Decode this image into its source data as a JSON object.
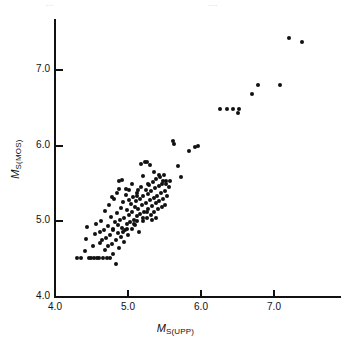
{
  "figure": {
    "page_fragments": {
      "left": "...",
      "right": "...."
    }
  },
  "chart_data": {
    "type": "scatter",
    "title": "",
    "xlabel": "M_S(UPP)",
    "ylabel": "M_S(MOS)",
    "xlabel_main": "M",
    "xlabel_sub": "S(UPP)",
    "ylabel_main": "M",
    "ylabel_sub": "S(MOS)",
    "xlim": [
      4.0,
      7.9
    ],
    "ylim": [
      4.0,
      7.7
    ],
    "xticks": [
      4.0,
      5.0,
      6.0,
      7.0
    ],
    "yticks": [
      4.0,
      5.0,
      6.0,
      7.0
    ],
    "xtick_labels": [
      "4.0",
      "5.0",
      "6.0",
      "7.0"
    ],
    "ytick_labels": [
      "4.0",
      "5.0",
      "6.0",
      "7.0"
    ],
    "grid": false,
    "legend": false,
    "marker": "filled-circle",
    "marker_color": "#111111",
    "n_points": 152,
    "points": [
      [
        4.3,
        4.51
      ],
      [
        4.36,
        4.51
      ],
      [
        4.41,
        4.61
      ],
      [
        4.43,
        4.77
      ],
      [
        4.44,
        4.93
      ],
      [
        4.47,
        4.51
      ],
      [
        4.49,
        4.51
      ],
      [
        4.52,
        4.67
      ],
      [
        4.54,
        4.51
      ],
      [
        4.55,
        4.83
      ],
      [
        4.56,
        4.97
      ],
      [
        4.58,
        4.51
      ],
      [
        4.6,
        4.51
      ],
      [
        4.61,
        4.72
      ],
      [
        4.62,
        4.86
      ],
      [
        4.63,
        5.01
      ],
      [
        4.65,
        4.75
      ],
      [
        4.66,
        4.51
      ],
      [
        4.67,
        4.89
      ],
      [
        4.68,
        4.62
      ],
      [
        4.69,
        5.14
      ],
      [
        4.7,
        4.78
      ],
      [
        4.71,
        4.51
      ],
      [
        4.72,
        4.94
      ],
      [
        4.73,
        4.67
      ],
      [
        4.74,
        5.22
      ],
      [
        4.75,
        4.82
      ],
      [
        4.76,
        4.51
      ],
      [
        4.77,
        5.06
      ],
      [
        4.78,
        4.7
      ],
      [
        4.79,
        4.88
      ],
      [
        4.8,
        4.57
      ],
      [
        4.81,
        5.3
      ],
      [
        4.82,
        4.99
      ],
      [
        4.83,
        4.76
      ],
      [
        4.84,
        4.43
      ],
      [
        4.85,
        5.11
      ],
      [
        4.86,
        4.84
      ],
      [
        4.87,
        5.43
      ],
      [
        4.88,
        4.65
      ],
      [
        4.89,
        5.02
      ],
      [
        4.9,
        4.79
      ],
      [
        4.91,
        5.18
      ],
      [
        4.92,
        4.91
      ],
      [
        4.93,
        5.26
      ],
      [
        4.94,
        4.73
      ],
      [
        4.95,
        5.05
      ],
      [
        4.96,
        4.88
      ],
      [
        4.97,
        5.35
      ],
      [
        4.98,
        4.96
      ],
      [
        4.99,
        5.15
      ],
      [
        5.0,
        4.82
      ],
      [
        5.01,
        5.08
      ],
      [
        5.02,
        5.41
      ],
      [
        5.03,
        4.99
      ],
      [
        5.04,
        5.23
      ],
      [
        5.05,
        4.9
      ],
      [
        5.06,
        5.12
      ],
      [
        5.07,
        5.32
      ],
      [
        5.08,
        5.02
      ],
      [
        5.09,
        5.19
      ],
      [
        5.1,
        4.95
      ],
      [
        5.11,
        5.27
      ],
      [
        5.12,
        5.07
      ],
      [
        5.13,
        5.38
      ],
      [
        5.14,
        5.16
      ],
      [
        5.15,
        4.86
      ],
      [
        5.16,
        5.29
      ],
      [
        5.17,
        5.1
      ],
      [
        5.18,
        5.45
      ],
      [
        5.19,
        5.22
      ],
      [
        5.2,
        5.01
      ],
      [
        5.21,
        5.33
      ],
      [
        5.22,
        5.13
      ],
      [
        5.23,
        5.78
      ],
      [
        5.24,
        5.41
      ],
      [
        5.25,
        5.25
      ],
      [
        5.26,
        5.05
      ],
      [
        5.27,
        5.36
      ],
      [
        5.28,
        5.17
      ],
      [
        5.29,
        5.48
      ],
      [
        5.3,
        5.28
      ],
      [
        5.31,
        5.09
      ],
      [
        5.32,
        5.4
      ],
      [
        5.33,
        5.21
      ],
      [
        5.34,
        5.52
      ],
      [
        5.35,
        5.31
      ],
      [
        5.36,
        5.13
      ],
      [
        5.37,
        5.44
      ],
      [
        5.38,
        5.24
      ],
      [
        5.39,
        5.56
      ],
      [
        5.4,
        5.34
      ],
      [
        5.41,
        5.16
      ],
      [
        5.42,
        5.47
      ],
      [
        5.43,
        5.27
      ],
      [
        5.44,
        5.59
      ],
      [
        5.45,
        5.37
      ],
      [
        5.46,
        5.19
      ],
      [
        5.47,
        5.5
      ],
      [
        5.48,
        5.3
      ],
      [
        5.49,
        5.62
      ],
      [
        5.5,
        5.4
      ],
      [
        5.51,
        5.22
      ],
      [
        5.52,
        5.53
      ],
      [
        5.53,
        5.33
      ],
      [
        4.88,
        5.53
      ],
      [
        4.92,
        5.55
      ],
      [
        5.18,
        5.76
      ],
      [
        5.26,
        5.78
      ],
      [
        5.3,
        5.74
      ],
      [
        5.21,
        5.6
      ],
      [
        5.28,
        5.5
      ],
      [
        5.14,
        5.42
      ],
      [
        5.06,
        5.49
      ],
      [
        4.97,
        5.43
      ],
      [
        4.85,
        5.38
      ],
      [
        4.78,
        5.32
      ],
      [
        5.02,
        5.28
      ],
      [
        5.12,
        5.34
      ],
      [
        5.36,
        5.66
      ],
      [
        5.42,
        5.61
      ],
      [
        5.48,
        5.54
      ],
      [
        5.52,
        5.5
      ],
      [
        5.56,
        5.46
      ],
      [
        5.58,
        5.54
      ],
      [
        5.12,
        5.01
      ],
      [
        5.2,
        5.05
      ],
      [
        5.26,
        5.12
      ],
      [
        5.33,
        5.02
      ],
      [
        5.38,
        5.04
      ],
      [
        5.08,
        4.97
      ],
      [
        4.99,
        4.9
      ],
      [
        4.93,
        4.86
      ],
      [
        4.86,
        4.95
      ],
      [
        4.8,
        4.9
      ],
      [
        5.62,
        6.07
      ],
      [
        5.63,
        6.02
      ],
      [
        5.68,
        5.73
      ],
      [
        5.72,
        5.59
      ],
      [
        5.84,
        5.93
      ],
      [
        5.92,
        5.98
      ],
      [
        5.96,
        6.0
      ],
      [
        6.26,
        6.49
      ],
      [
        6.36,
        6.49
      ],
      [
        6.44,
        6.49
      ],
      [
        6.5,
        6.43
      ],
      [
        6.52,
        6.49
      ],
      [
        6.7,
        6.68
      ],
      [
        6.78,
        6.8
      ],
      [
        7.08,
        6.8
      ],
      [
        7.2,
        7.43
      ],
      [
        7.38,
        7.37
      ]
    ]
  }
}
